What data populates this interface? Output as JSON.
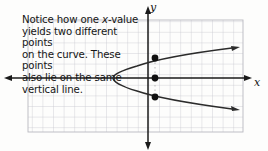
{
  "figure": {
    "name": "parabola-vertical-line-test-figure",
    "background_color": "#fdfdfc",
    "annotation": {
      "line1": "Notice how one ",
      "line1_italic": "x",
      "line1_rest": "-value",
      "line2": "yields two different points",
      "line3": "on the curve.  These points",
      "line4": "also lie on the same",
      "line5": "vertical line.",
      "full_text": "Notice how one x-value yields two different points on the curve. These points also lie on the same vertical line."
    },
    "axes": {
      "x_label": "x",
      "y_label": "y",
      "axis_color": "#1a1a1a",
      "x_axis_y": 78,
      "y_axis_x": 148
    },
    "grid": {
      "color": "#c9c9cf",
      "cell_size": 10.6,
      "left": 28,
      "top": 20,
      "right": 243,
      "bottom": 132,
      "visible": true
    },
    "curve": {
      "type": "parabola",
      "orientation": "opens-right",
      "color": "#2b2b2b",
      "vertex": {
        "x": 113,
        "y": 78
      },
      "arrow_upper": {
        "x": 238,
        "y": 51
      },
      "arrow_lower": {
        "x": 238,
        "y": 106
      }
    },
    "points": [
      {
        "label": "upper-intersection",
        "x": 155,
        "y": 58
      },
      {
        "label": "center-intersection",
        "x": 155,
        "y": 78
      },
      {
        "label": "lower-intersection",
        "x": 155,
        "y": 97
      }
    ],
    "vertical_line": {
      "x": 155,
      "top": 58,
      "bottom": 97,
      "style": "faint-dashed",
      "color": "#9a9a9a"
    }
  }
}
